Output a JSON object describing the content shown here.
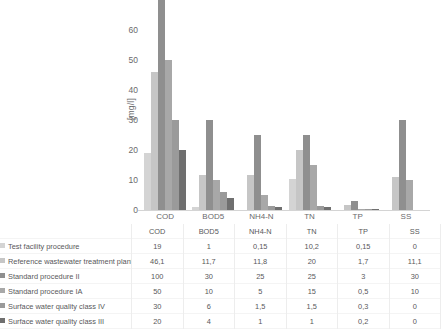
{
  "chart_data": {
    "type": "bar",
    "title": "",
    "subtitle": "",
    "xlabel": "",
    "ylabel": "[mg/l]",
    "ylim": [
      0,
      70
    ],
    "ytick_values": [
      0,
      10,
      20,
      30,
      40,
      50,
      60
    ],
    "ytick_labels": [
      "0",
      "10",
      "20",
      "30",
      "40",
      "50",
      "60"
    ],
    "grid": false,
    "legend_position": "data-table-below",
    "clipped_note": "Bars exceeding the 0-70 axis range are clipped at the top of the plot area",
    "categories": [
      "COD",
      "BOD5",
      "NH4-N",
      "TN",
      "TP",
      "SS"
    ],
    "series": [
      {
        "name": "Test facility procedure",
        "color": "#d4d4d4",
        "values": [
          19,
          1,
          0.15,
          10.2,
          0.15,
          0
        ],
        "display_values": [
          "19",
          "1",
          "0,15",
          "10,2",
          "0,15",
          "0"
        ]
      },
      {
        "name": "Reference wastewater treatment plant",
        "color": "#c6c6c6",
        "values": [
          46.1,
          11.7,
          11.8,
          20,
          1.7,
          11.1
        ],
        "display_values": [
          "46,1",
          "11,7",
          "11,8",
          "20",
          "1,7",
          "11,1"
        ]
      },
      {
        "name": "Standard procedure II",
        "color": "#8f8f8f",
        "values": [
          100,
          30,
          25,
          25,
          3,
          30
        ],
        "display_values": [
          "100",
          "30",
          "25",
          "25",
          "3",
          "30"
        ]
      },
      {
        "name": "Standard procedure IA",
        "color": "#a8a8a8",
        "values": [
          50,
          10,
          5,
          15,
          0.5,
          10
        ],
        "display_values": [
          "50",
          "10",
          "5",
          "15",
          "0,5",
          "10"
        ]
      },
      {
        "name": "Surface water quality class IV",
        "color": "#9a9a9a",
        "values": [
          30,
          6,
          1.5,
          1.5,
          0.3,
          0
        ],
        "display_values": [
          "30",
          "6",
          "1,5",
          "1,5",
          "0,3",
          "0"
        ]
      },
      {
        "name": "Surface water quality class III",
        "color": "#6f6f6f",
        "values": [
          20,
          4,
          1,
          1,
          0.2,
          0
        ],
        "display_values": [
          "20",
          "4",
          "1",
          "1",
          "0,2",
          "0"
        ]
      }
    ]
  }
}
